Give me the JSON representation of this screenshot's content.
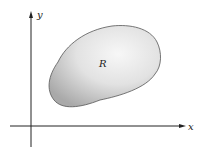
{
  "diagram": {
    "region_label": "R",
    "x_axis_label": "x",
    "y_axis_label": "y",
    "colors": {
      "axis": "#222222",
      "region_fill_light": "#f4f4f4",
      "region_fill_dark": "#b8b8b8",
      "region_stroke": "#555555"
    }
  }
}
